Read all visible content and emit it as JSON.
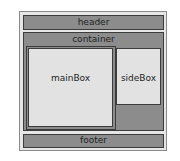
{
  "diagram": {
    "header": {
      "label": "header"
    },
    "container": {
      "label": "container"
    },
    "mainBox": {
      "label": "mainBox"
    },
    "sideBox": {
      "label": "sideBox"
    },
    "footer": {
      "label": "footer"
    }
  },
  "colors": {
    "outer_bg": "#e6e6e6",
    "dark_box": "#8c8c8c",
    "light_box": "#e2e2e2",
    "border": "#3c3c3c"
  }
}
